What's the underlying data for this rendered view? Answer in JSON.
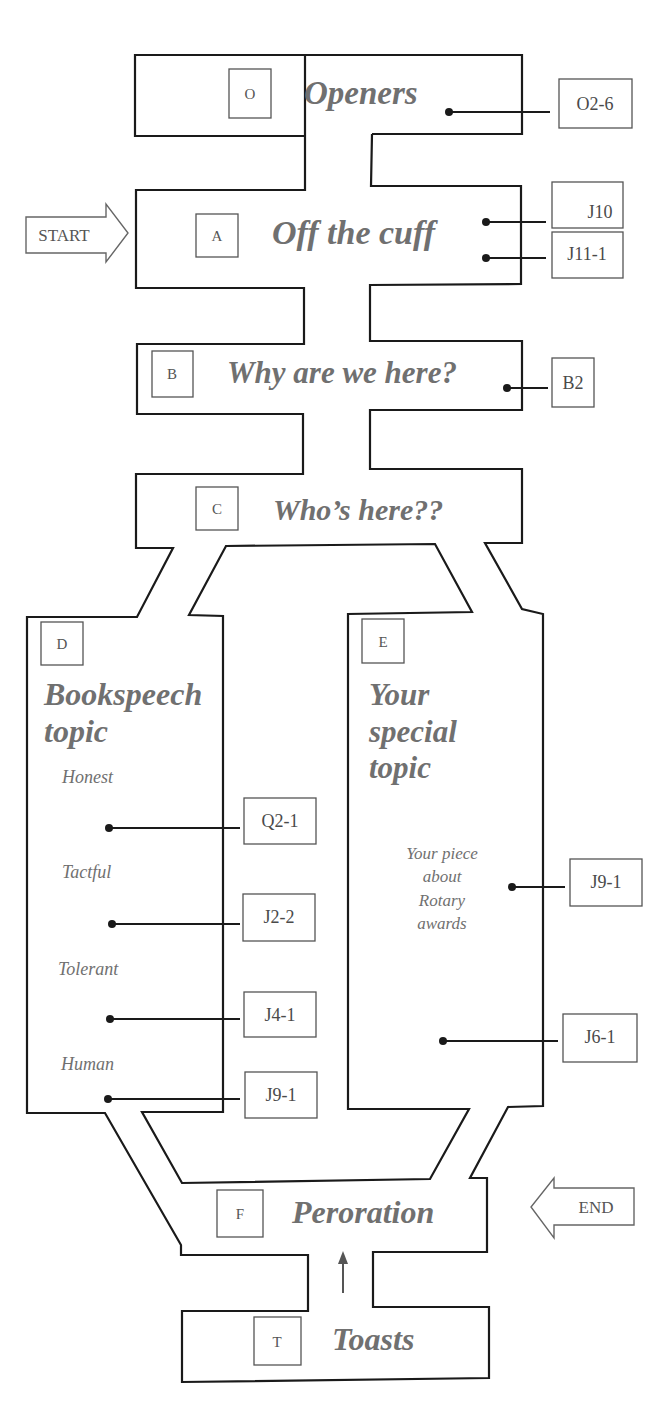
{
  "diagram": {
    "type": "speech-flow-maze",
    "start_label": "START",
    "end_label": "END",
    "colors": {
      "outline": "#1a1a1a",
      "text": "#707070",
      "box_border": "#555555"
    },
    "sections": {
      "O": {
        "letter": "O",
        "title": "Openers",
        "refs": [
          "O2-6"
        ]
      },
      "A": {
        "letter": "A",
        "title": "Off the cuff",
        "refs": [
          "J10",
          "J11-1"
        ]
      },
      "B": {
        "letter": "B",
        "title": "Why are we here?",
        "refs": [
          "B2"
        ]
      },
      "C": {
        "letter": "C",
        "title": "Who’s here??",
        "refs": []
      },
      "D": {
        "letter": "D",
        "title_line1": "Bookspeech",
        "title_line2": "topic",
        "items": [
          {
            "label": "Honest",
            "ref": "Q2-1"
          },
          {
            "label": "Tactful",
            "ref": "J2-2"
          },
          {
            "label": "Tolerant",
            "ref": "J4-1"
          },
          {
            "label": "Human",
            "ref": "J9-1"
          }
        ]
      },
      "E": {
        "letter": "E",
        "title_line1": "Your",
        "title_line2": "special",
        "title_line3": "topic",
        "note_lines": [
          "Your piece",
          "about",
          "Rotary",
          "awards"
        ],
        "refs": [
          "J9-1",
          "J6-1"
        ]
      },
      "F": {
        "letter": "F",
        "title": "Peroration",
        "refs": []
      },
      "T": {
        "letter": "T",
        "title": "Toasts",
        "refs": []
      }
    }
  }
}
